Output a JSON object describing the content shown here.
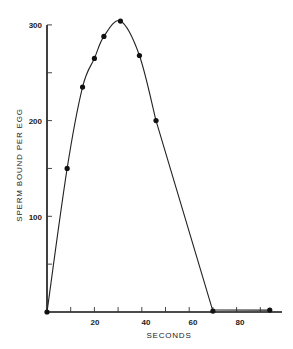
{
  "chart_data": {
    "type": "line",
    "title": "",
    "xlabel": "SECONDS",
    "ylabel": "SPERM BOUND PER EGG",
    "xlim": [
      0,
      95
    ],
    "ylim": [
      0,
      300
    ],
    "x_ticks": [
      0,
      10,
      20,
      30,
      40,
      50,
      60,
      70,
      80,
      90
    ],
    "x_tick_labels": [
      "20",
      "40",
      "60",
      "80"
    ],
    "x_tick_label_values": [
      20,
      40,
      60,
      80
    ],
    "y_ticks": [
      50,
      100,
      150,
      200,
      250,
      300
    ],
    "y_tick_labels": [
      "100",
      "200",
      "300"
    ],
    "y_tick_label_values": [
      100,
      200,
      300
    ],
    "grid": false,
    "legend": null,
    "series": [
      {
        "name": "Sperm bound per egg",
        "x": [
          0,
          8.5,
          15,
          20,
          24,
          31,
          39,
          46,
          70,
          94
        ],
        "values": [
          0,
          150,
          235,
          265,
          288,
          304,
          268,
          200,
          1,
          2
        ],
        "markers": true,
        "color": "#111111"
      }
    ]
  }
}
